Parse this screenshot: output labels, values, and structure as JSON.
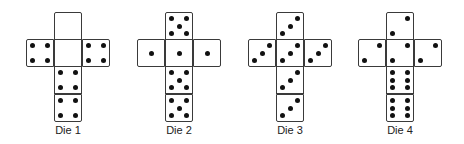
{
  "dice": [
    {
      "label": "Die 1",
      "left": 26,
      "faces": {
        "top": 0,
        "left": 4,
        "center": 0,
        "right": 4,
        "below": 4,
        "bottom": 4
      }
    },
    {
      "label": "Die 2",
      "left": 137,
      "faces": {
        "top": 5,
        "left": 1,
        "center": 1,
        "right": 1,
        "below": 5,
        "bottom": 5
      }
    },
    {
      "label": "Die 3",
      "left": 248,
      "faces": {
        "top": 3,
        "left": 3,
        "center": 3,
        "right": 3,
        "below": 3,
        "bottom": 3
      }
    },
    {
      "label": "Die 4",
      "left": 358,
      "faces": {
        "top": 2,
        "left": 2,
        "center": 2,
        "right": 2,
        "below": 6,
        "bottom": 6
      }
    }
  ],
  "colors": {
    "pip": "#111111",
    "border": "#3a3a3a",
    "label": "#222222"
  }
}
